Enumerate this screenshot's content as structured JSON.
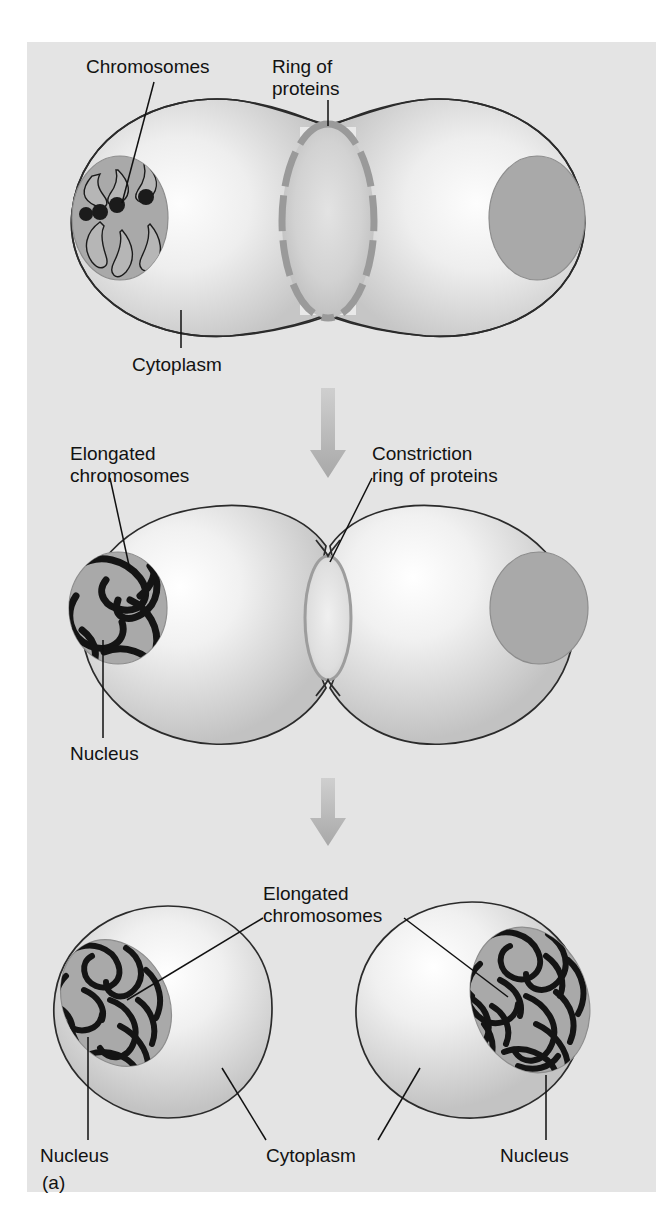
{
  "figure": {
    "panel_letter": "(a)",
    "background_color": "#ffffff",
    "panel_color": "#e4e4e4",
    "ink_color": "#121212",
    "arrow_color": "#b2b2b2",
    "nucleus_color": "#a8a8a8",
    "ring_color": "#9a9a9a"
  },
  "stages": [
    {
      "id": "stage-1",
      "name": "early-cleavage",
      "labels": {
        "chromosomes": "Chromosomes",
        "ring_of_proteins": "Ring of\nproteins",
        "ring_of_proteins_line1": "Ring of",
        "ring_of_proteins_line2": "proteins",
        "cytoplasm": "Cytoplasm"
      }
    },
    {
      "id": "stage-2",
      "name": "constriction",
      "labels": {
        "elongated_chromosomes_line1": "Elongated",
        "elongated_chromosomes_line2": "chromosomes",
        "constriction_ring_line1": "Constriction",
        "constriction_ring_line2": "ring of proteins",
        "nucleus": "Nucleus"
      }
    },
    {
      "id": "stage-3",
      "name": "separated-daughter-cells",
      "labels": {
        "elongated_chromosomes_line1": "Elongated",
        "elongated_chromosomes_line2": "chromosomes",
        "nucleus_left": "Nucleus",
        "cytoplasm": "Cytoplasm",
        "nucleus_right": "Nucleus"
      }
    }
  ],
  "arrows": [
    {
      "id": "arrow-stage1-to-stage2",
      "direction": "down"
    },
    {
      "id": "arrow-stage2-to-stage3",
      "direction": "down"
    }
  ]
}
